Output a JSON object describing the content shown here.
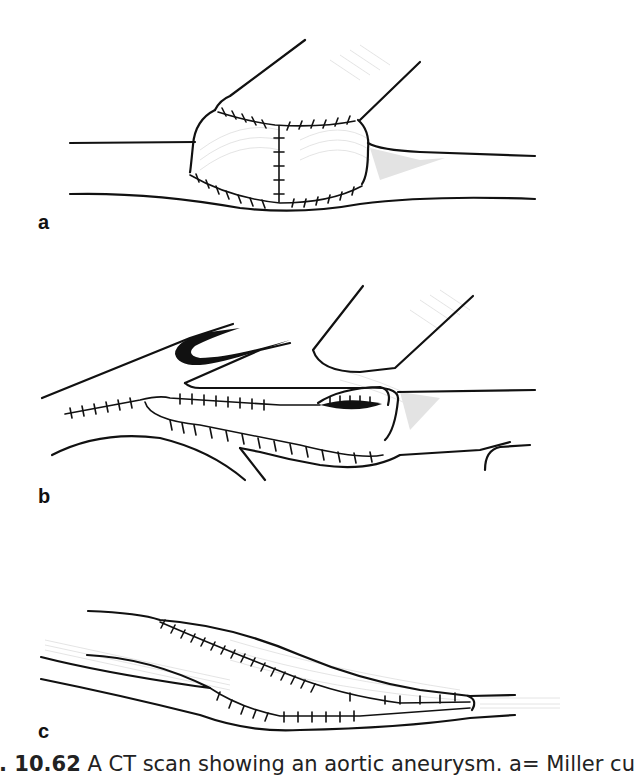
{
  "figure": {
    "panels": [
      {
        "label": "a"
      },
      {
        "label": "b"
      },
      {
        "label": "c"
      }
    ],
    "caption": {
      "figure_number": "g. 10.62",
      "text": " A CT scan showing an aortic aneurysm. a= Miller cu"
    }
  }
}
